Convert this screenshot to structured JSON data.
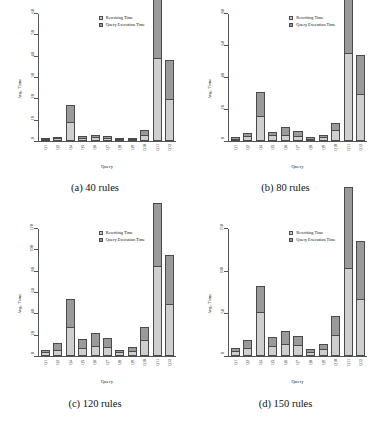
{
  "figure": {
    "legend": {
      "rewriting_label": "Rewriting Time",
      "execution_label": "Query Execution Time",
      "rewriting_color": "#cfcfcf",
      "execution_color": "#9a9a9a"
    },
    "axis": {
      "xlabel": "Query",
      "ylabel": "Avg. Time"
    },
    "panels": [
      {
        "caption": "(a) 40 rules",
        "chart_data": {
          "type": "bar",
          "stacked": true,
          "title": "(a) 40 rules",
          "xlabel": "Query",
          "ylabel": "Avg. Time",
          "ylim": [
            0,
            60
          ],
          "yticks": [
            0,
            10,
            20,
            30,
            40,
            50,
            60
          ],
          "grid": false,
          "legend_position": "top-center",
          "categories": [
            "Q1",
            "Q2",
            "Q4",
            "Q5",
            "Q6",
            "Q7",
            "Q8",
            "Q9",
            "Q10",
            "Q11",
            "Q12"
          ],
          "series": [
            {
              "name": "Rewriting Time",
              "values": [
                0.6,
                1.0,
                7.5,
                1.2,
                1.5,
                1.2,
                0.6,
                0.8,
                2.5,
                32,
                16
              ]
            },
            {
              "name": "Query Execution Time",
              "values": [
                0.4,
                0.5,
                6.5,
                0.6,
                1.0,
                0.8,
                0.4,
                0.5,
                1.8,
                27,
                15
              ]
            }
          ]
        }
      },
      {
        "caption": "(b) 80 rules",
        "chart_data": {
          "type": "bar",
          "stacked": true,
          "title": "(b) 80 rules",
          "xlabel": "Query",
          "ylabel": "Avg. Time",
          "ylim": [
            0,
            80
          ],
          "yticks": [
            0,
            20,
            40,
            60,
            80
          ],
          "grid": false,
          "legend_position": "top-center",
          "categories": [
            "Q1",
            "Q2",
            "Q4",
            "Q5",
            "Q6",
            "Q7",
            "Q8",
            "Q9",
            "Q10",
            "Q11",
            "Q12"
          ],
          "series": [
            {
              "name": "Rewriting Time",
              "values": [
                1.2,
                2.5,
                13,
                3.0,
                3.0,
                2.8,
                1.2,
                2.0,
                5.5,
                45,
                24
              ]
            },
            {
              "name": "Query Execution Time",
              "values": [
                0.8,
                1.5,
                12,
                1.5,
                4.0,
                2.2,
                0.8,
                1.0,
                3.5,
                37,
                20
              ]
            }
          ]
        }
      },
      {
        "caption": "(c) 120 rules",
        "chart_data": {
          "type": "bar",
          "stacked": true,
          "title": "(c) 120 rules",
          "xlabel": "Query",
          "ylabel": "Avg. Time",
          "ylim": [
            0,
            120
          ],
          "yticks": [
            0,
            20,
            40,
            60,
            80,
            100,
            120
          ],
          "grid": false,
          "legend_position": "top-center",
          "categories": [
            "Q1",
            "Q2",
            "Q4",
            "Q5",
            "Q6",
            "Q7",
            "Q8",
            "Q9",
            "Q10",
            "Q11",
            "Q12"
          ],
          "series": [
            {
              "name": "Rewriting Time",
              "values": [
                3,
                5,
                22,
                6,
                8,
                7,
                3,
                4,
                12,
                69,
                40
              ]
            },
            {
              "name": "Query Execution Time",
              "values": [
                2,
                5,
                22,
                7,
                10,
                7,
                2,
                3,
                10,
                49,
                38
              ]
            }
          ]
        }
      },
      {
        "caption": "(d) 150 rules",
        "chart_data": {
          "type": "bar",
          "stacked": true,
          "title": "(d) 150 rules",
          "xlabel": "Query",
          "ylabel": "Avg. Time",
          "ylim": [
            0,
            150
          ],
          "yticks": [
            0,
            50,
            100,
            150
          ],
          "grid": false,
          "legend_position": "top-center",
          "categories": [
            "Q1",
            "Q2",
            "Q4",
            "Q5",
            "Q6",
            "Q7",
            "Q8",
            "Q9",
            "Q10",
            "Q11",
            "Q12"
          ],
          "series": [
            {
              "name": "Rewriting Time",
              "values": [
                5,
                8,
                42,
                10,
                12,
                11,
                4,
                7,
                20,
                85,
                55
              ]
            },
            {
              "name": "Query Execution Time",
              "values": [
                3,
                7,
                25,
                8,
                12,
                8,
                3,
                5,
                18,
                78,
                56
              ]
            }
          ]
        }
      }
    ]
  }
}
